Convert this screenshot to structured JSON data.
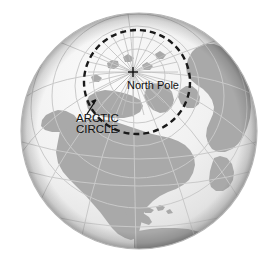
{
  "figure": {
    "name": "earth-globe-arctic-circle-diagram",
    "background_color": "#ffffff"
  },
  "globe": {
    "center_x": 139,
    "center_y": 131,
    "radius": 118,
    "ocean_color": "#efefef",
    "land_color": "#a9a9a9",
    "graticule_color": "#c9c9c9",
    "rim_shadow_color": "#9d9d9d",
    "outline_color": "#b5b5b5",
    "projection": "orthographic",
    "center_view": "North Pole / North America"
  },
  "arctic_circle": {
    "label_line_1": "ARCTIC",
    "label_line_2": "CIRCLE",
    "stroke_color": "#1a1a1a",
    "dash_pattern": "6 4",
    "stroke_width": 2.4,
    "ellipse_cx": 137,
    "ellipse_cy": 82,
    "ellipse_rx": 53,
    "ellipse_ry": 52,
    "label_x": 76,
    "label_y_1": 122,
    "label_y_2": 133,
    "font_size": 11.5,
    "leader_from_x": 88,
    "leader_from_y": 113,
    "leader_to_x": 96,
    "leader_to_y": 99
  },
  "north_pole": {
    "label": "North Pole",
    "marker": "plus-cross",
    "marker_x": 133,
    "marker_y": 72,
    "marker_size": 5,
    "label_x": 127,
    "label_y": 89,
    "font_size": 11,
    "color": "#111111"
  },
  "graticule": {
    "meridian_count": 12,
    "parallel_count": 7,
    "radial_lines_at_pole": 24
  },
  "landmasses": [
    "North America",
    "Greenland",
    "South America",
    "Eurasia",
    "Africa",
    "Arctic islands"
  ]
}
